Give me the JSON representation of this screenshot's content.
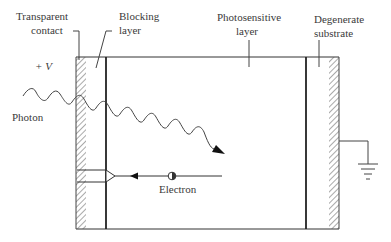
{
  "diagram": {
    "type": "photoconductor cross-section",
    "labels": {
      "transparent_contact_line1": "Transparent",
      "transparent_contact_line2": "contact",
      "blocking_layer_line1": "Blocking",
      "blocking_layer_line2": "layer",
      "photosensitive_layer_line1": "Photosensitive",
      "photosensitive_layer_line2": "layer",
      "degenerate_substrate_line1": "Degenerate",
      "degenerate_substrate_line2": "substrate",
      "voltage": "+ V",
      "photon": "Photon",
      "electron": "Electron"
    },
    "components": [
      "transparent contact (hatched)",
      "blocking layer",
      "photosensitive layer",
      "degenerate substrate (hatched)",
      "ground symbol"
    ],
    "colors": {
      "line": "#2a2a2a",
      "hatch": "#555555",
      "background": "#ffffff"
    }
  }
}
